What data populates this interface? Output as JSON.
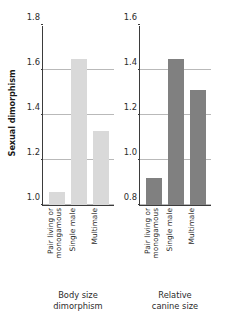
{
  "chart_data": {
    "type": "bar",
    "title": "",
    "ylabel": "Sexual dimorphism",
    "xlabel": "",
    "grid": true,
    "legend": "none",
    "panels": [
      {
        "id": "body-size-dimorphism",
        "caption_line1": "Body size",
        "caption_line2": "dimorphism",
        "bar_color": "#d9d9d9",
        "ylim": [
          1.0,
          1.8
        ],
        "yticks": [
          "1.0",
          "1.2",
          "1.4",
          "1.6",
          "1.8"
        ],
        "ytick_values": [
          1.0,
          1.2,
          1.4,
          1.6,
          1.8
        ],
        "categories": [
          "Pair living or monogamous",
          "Single male",
          "Multimale"
        ],
        "category_lines": [
          [
            "Pair living or",
            "monogamous"
          ],
          [
            "Single male",
            ""
          ],
          [
            "Multimale",
            ""
          ]
        ],
        "values": [
          1.06,
          1.65,
          1.33
        ]
      },
      {
        "id": "relative-canine-size",
        "caption_line1": "Relative",
        "caption_line2": "canine size",
        "bar_color": "#808080",
        "ylim": [
          0.8,
          1.6
        ],
        "yticks": [
          "0.8",
          "1.0",
          "1.2",
          "1.4",
          "1.6"
        ],
        "ytick_values": [
          0.8,
          1.0,
          1.2,
          1.4,
          1.6
        ],
        "categories": [
          "Pair living or monogamous",
          "Single male",
          "Multimale"
        ],
        "category_lines": [
          [
            "Pair living or",
            "monogamous"
          ],
          [
            "Single male",
            ""
          ],
          [
            "Multimale",
            ""
          ]
        ],
        "values": [
          0.92,
          1.45,
          1.31
        ]
      }
    ],
    "axis_color": "#3b3b3b",
    "gridline_color": "#b9b9b9",
    "text_color": "#2b2b2b"
  }
}
